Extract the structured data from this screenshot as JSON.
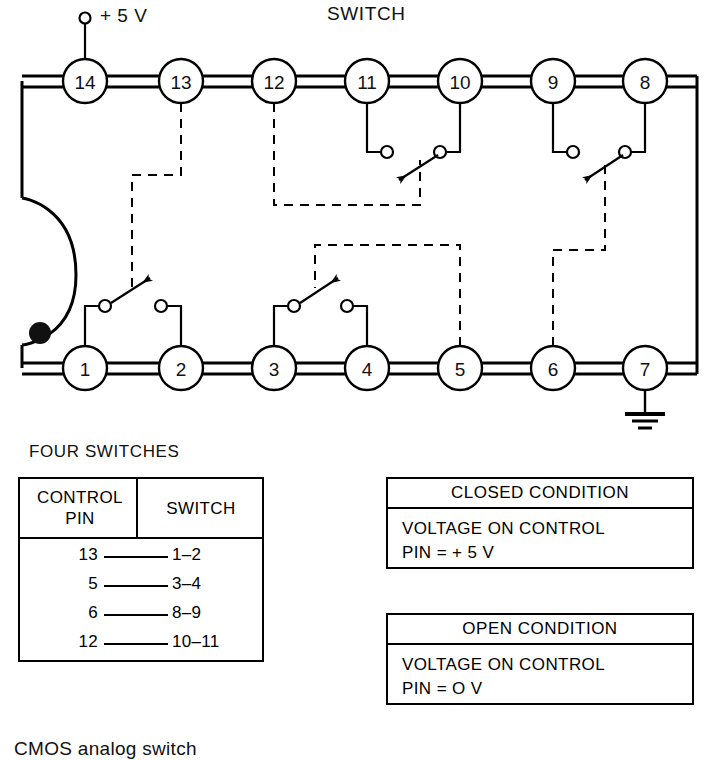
{
  "figure": {
    "caption": "CMOS analog switch",
    "switch_label": "SWITCH",
    "supply_label": "+ 5 V",
    "four_switches_label": "FOUR SWITCHES"
  },
  "ic": {
    "top_pins": [
      "14",
      "13",
      "12",
      "11",
      "10",
      "9",
      "8"
    ],
    "bottom_pins": [
      "1",
      "2",
      "3",
      "4",
      "5",
      "6",
      "7"
    ],
    "ground_pin": "7",
    "supply_pin": "14"
  },
  "table": {
    "headers": [
      "CONTROL PIN",
      "SWITCH"
    ],
    "header_line1": "CONTROL",
    "header_line2": "PIN",
    "header_right": "SWITCH",
    "rows": [
      {
        "control_pin": "13",
        "switch": "1–2"
      },
      {
        "control_pin": "5",
        "switch": "3–4"
      },
      {
        "control_pin": "6",
        "switch": "8–9"
      },
      {
        "control_pin": "12",
        "switch": "10–11"
      }
    ]
  },
  "conditions": [
    {
      "title": "CLOSED CONDITION",
      "line1": "VOLTAGE ON CONTROL",
      "line2": "PIN  =  + 5 V"
    },
    {
      "title": "OPEN CONDITION",
      "line1": "VOLTAGE ON CONTROL",
      "line2": "PIN  =  O V"
    }
  ],
  "colors": {
    "ink": "#000000",
    "background": "#ffffff"
  }
}
